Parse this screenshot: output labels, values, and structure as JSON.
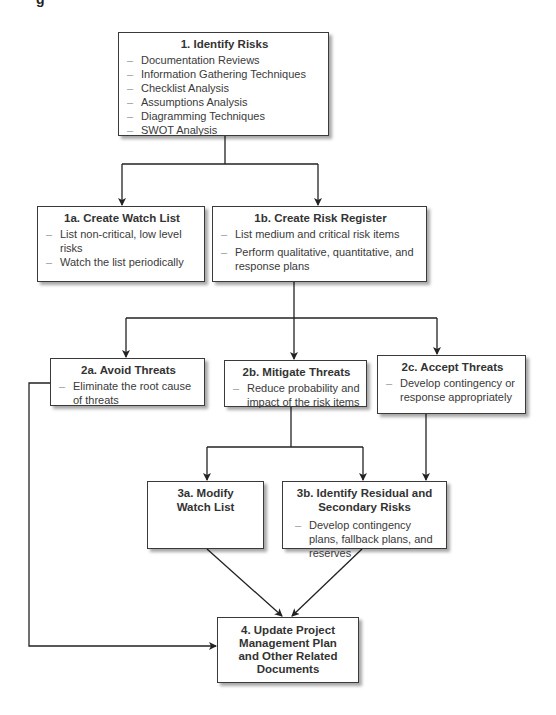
{
  "header": {
    "partial_text": "g"
  },
  "nodes": {
    "n1": {
      "title": "1. Identify Risks",
      "items": [
        "Documentation Reviews",
        "Information Gathering Techniques",
        "Checklist Analysis",
        "Assumptions Analysis",
        "Diagramming Techniques",
        "SWOT Analysis"
      ]
    },
    "n1a": {
      "title": "1a. Create Watch List",
      "items": [
        "List non-critical, low level risks",
        "Watch the list periodically"
      ]
    },
    "n1b": {
      "title": "1b. Create Risk Register",
      "items": [
        "List medium and critical risk items",
        "Perform qualitative, quantitative, and response plans"
      ]
    },
    "n2a": {
      "title": "2a. Avoid Threats",
      "items": [
        "Eliminate the root cause of threats"
      ]
    },
    "n2b": {
      "title": "2b. Mitigate Threats",
      "items": [
        "Reduce probability and impact of the risk items"
      ]
    },
    "n2c": {
      "title": "2c. Accept Threats",
      "items": [
        "Develop contingency or response appropriately"
      ]
    },
    "n3a": {
      "title": "3a. Modify Watch List",
      "items": []
    },
    "n3b": {
      "title": "3b. Identify Residual and Secondary Risks",
      "items": [
        "Develop contingency plans, fallback plans, and reserves"
      ]
    },
    "n4": {
      "title": "4. Update Project Management Plan and Other Related Documents",
      "items": []
    }
  },
  "edges": [
    [
      "n1",
      "n1a"
    ],
    [
      "n1",
      "n1b"
    ],
    [
      "n1b",
      "n2a"
    ],
    [
      "n1b",
      "n2b"
    ],
    [
      "n1b",
      "n2c"
    ],
    [
      "n2b",
      "n3a"
    ],
    [
      "n2b",
      "n3b"
    ],
    [
      "n2c",
      "n3b"
    ],
    [
      "n2a",
      "n4"
    ],
    [
      "n3a",
      "n4"
    ],
    [
      "n3b",
      "n4"
    ]
  ],
  "colors": {
    "line": "#222222",
    "border": "#3a3a3a",
    "text": "#333333",
    "dash": "#9a9a9a"
  }
}
